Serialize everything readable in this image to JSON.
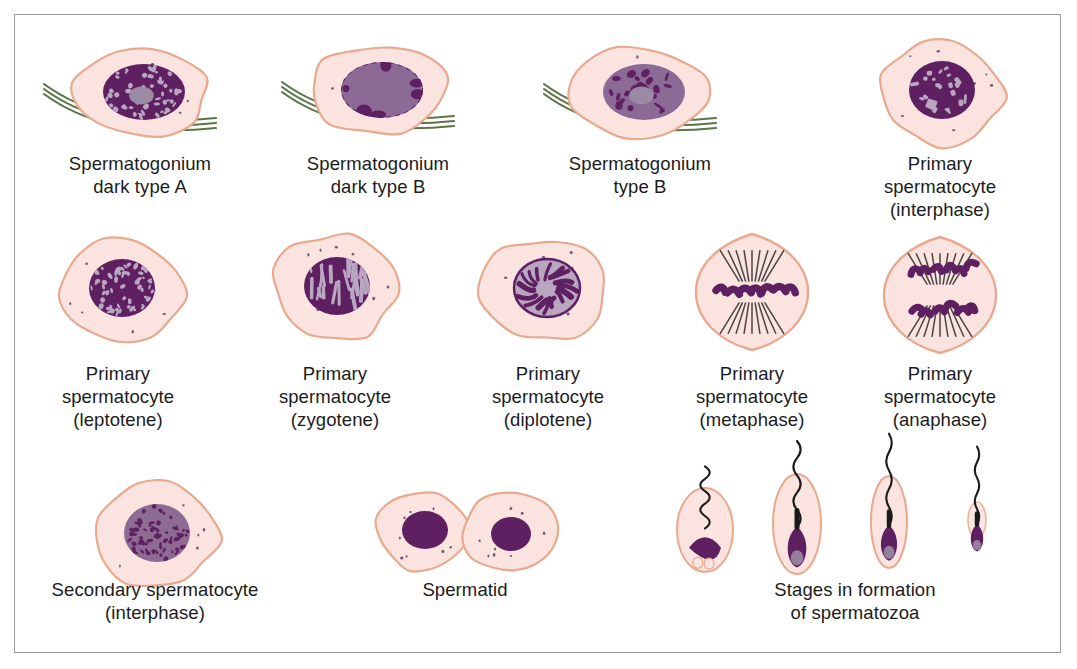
{
  "figure": {
    "border_color": "#9a9a9a",
    "background": "#ffffff"
  },
  "palette": {
    "cytoplasm_fill": "#fbe4e0",
    "cytoplasm_edge": "#e8a98f",
    "nucleus_dark": "#5e2061",
    "nucleus_mid": "#8c6a96",
    "nucleolus": "#9b8aa4",
    "chromatin_pale": "#b9a7c2",
    "basement_membrane": "#4a6633",
    "tail_color": "#1a1a1a",
    "granule": "#3b3050",
    "text_color": "#1b1b1b"
  },
  "rows": [
    {
      "name": "row-spermatogonia",
      "cells": [
        {
          "id": "spermatogonium-dark-type-a",
          "label_lines": [
            "Spermatogonium",
            "dark type A"
          ],
          "cx": 140,
          "cy": 92,
          "label_x": 140,
          "label_y": 152,
          "shape": "oval-blob",
          "has_membrane": true,
          "nucleus_style": "dark-speckled",
          "nucleolus": true
        },
        {
          "id": "spermatogonium-dark-type-b",
          "label_lines": [
            "Spermatogonium",
            "dark type B"
          ],
          "cx": 378,
          "cy": 90,
          "label_x": 378,
          "label_y": 152,
          "shape": "oval-blob",
          "has_membrane": true,
          "nucleus_style": "pale-round",
          "nucleolus": false
        },
        {
          "id": "spermatogonium-type-b",
          "label_lines": [
            "Spermatogonium",
            "type B"
          ],
          "cx": 640,
          "cy": 92,
          "label_x": 640,
          "label_y": 152,
          "shape": "oval-blob",
          "has_membrane": true,
          "nucleus_style": "mottled",
          "nucleolus": true
        },
        {
          "id": "primary-spermatocyte-interphase",
          "label_lines": [
            "Primary spermatocyte",
            "(interphase)"
          ],
          "cx": 940,
          "cy": 92,
          "label_x": 940,
          "label_y": 152,
          "shape": "round-blob",
          "has_membrane": false,
          "nucleus_style": "dark-threads",
          "nucleolus": false
        }
      ]
    },
    {
      "name": "row-primary-spermatocytes",
      "cells": [
        {
          "id": "primary-spermatocyte-leptotene",
          "label_lines": [
            "Primary",
            "spermatocyte",
            "(leptotene)"
          ],
          "cx": 120,
          "cy": 290,
          "label_x": 118,
          "label_y": 362,
          "shape": "round-blob",
          "has_membrane": false,
          "nucleus_style": "dark-speckled",
          "nucleolus": false
        },
        {
          "id": "primary-spermatocyte-zygotene",
          "label_lines": [
            "Primary",
            "spermatocyte",
            "(zygotene)"
          ],
          "cx": 335,
          "cy": 288,
          "label_x": 335,
          "label_y": 362,
          "shape": "round-blob",
          "has_membrane": false,
          "nucleus_style": "threads-vertical",
          "nucleolus": false
        },
        {
          "id": "primary-spermatocyte-diplotene",
          "label_lines": [
            "Primary",
            "spermatocyte",
            "(diplotene)"
          ],
          "cx": 545,
          "cy": 290,
          "label_x": 548,
          "label_y": 362,
          "shape": "round-blob",
          "has_membrane": false,
          "nucleus_style": "loops-inverted",
          "nucleolus": false
        },
        {
          "id": "primary-spermatocyte-metaphase",
          "label_lines": [
            "Primary",
            "spermatocyte",
            "(metaphase)"
          ],
          "cx": 752,
          "cy": 292,
          "label_x": 752,
          "label_y": 362,
          "shape": "diamond-blob",
          "has_membrane": false,
          "nucleus_style": "metaphase-plate",
          "nucleolus": false
        },
        {
          "id": "primary-spermatocyte-anaphase",
          "label_lines": [
            "Primary",
            "spermatocyte",
            "(anaphase)"
          ],
          "cx": 940,
          "cy": 295,
          "label_x": 940,
          "label_y": 362,
          "shape": "diamond-blob",
          "has_membrane": false,
          "nucleus_style": "anaphase-poles",
          "nucleolus": false
        }
      ]
    },
    {
      "name": "row-spermatids-spermatozoa",
      "cells": [
        {
          "id": "secondary-spermatocyte-interphase",
          "label_lines": [
            "Secondary spermatocyte",
            "(interphase)"
          ],
          "cx": 155,
          "cy": 535,
          "label_x": 155,
          "label_y": 578,
          "shape": "round-blob",
          "has_membrane": false,
          "nucleus_style": "pale-speckled",
          "nucleolus": false
        },
        {
          "id": "spermatid-pair",
          "label_lines": [
            "Spermatid"
          ],
          "cx": 465,
          "cy": 532,
          "label_x": 465,
          "label_y": 578,
          "shape": "twin-blob",
          "has_membrane": false,
          "nucleus_style": "mottled-small",
          "nucleolus": false
        },
        {
          "id": "spermatozoa-stages",
          "label_lines": [
            "Stages in formation",
            "of spermatozoa"
          ],
          "cx": 855,
          "cy": 530,
          "label_x": 855,
          "label_y": 578,
          "shape": "spermatozoa-series",
          "has_membrane": false,
          "nucleus_style": "sperm-heads",
          "nucleolus": false
        }
      ]
    }
  ]
}
